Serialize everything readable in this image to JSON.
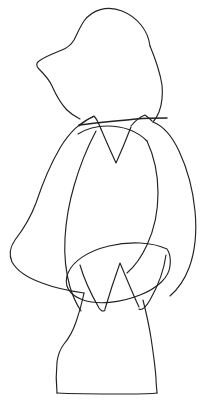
{
  "image": {
    "title": "Contour line drawing of a standing figurine",
    "subject": "bear-like standing figure on a pedestal base",
    "style": "single-weight ink contour line art",
    "background_color": "#ffffff",
    "stroke_color": "#222222",
    "width_px": 205,
    "height_px": 411,
    "caption": ""
  },
  "strokes": [
    {
      "name": "head-and-snout-outline",
      "description": "large rounded head dome sweeping left into a pointed snout and down the jaw to the neck",
      "weight": "normal"
    },
    {
      "name": "head-right-side-to-shoulder",
      "description": "right contour of head descending to the right shoulder",
      "weight": "normal"
    },
    {
      "name": "collar-band-line",
      "description": "near-horizontal band crossing the neck at the shoulders",
      "weight": "heavy"
    },
    {
      "name": "left-collar-peak",
      "description": "small triangular peak of the collar on the left of the neck",
      "weight": "normal"
    },
    {
      "name": "right-collar-peak",
      "description": "small triangular peak of the collar on the right of the neck",
      "weight": "normal"
    },
    {
      "name": "v-neck-line",
      "description": "V shaped neckline descending from the collar into the chest",
      "weight": "normal"
    },
    {
      "name": "chest-arc",
      "description": "broad arc of the upper chest below the collar",
      "weight": "normal"
    },
    {
      "name": "left-arm-outer-contour",
      "description": "long outer sweep of the left arm bulging out to the far left",
      "weight": "normal"
    },
    {
      "name": "left-arm-inner-contour",
      "description": "inner edge of the left arm running down into the waist",
      "weight": "normal"
    },
    {
      "name": "right-arm-outer-contour",
      "description": "outer contour of the right arm running down the right edge",
      "weight": "normal"
    },
    {
      "name": "right-arm-inner-contour",
      "description": "inner edge of the right arm curving into the hip",
      "weight": "normal"
    },
    {
      "name": "lower-ellipse-loop",
      "description": "elongated looping oval across the hips and lower body",
      "weight": "normal"
    },
    {
      "name": "drape-v-notch",
      "description": "pointed V fold of drapery below the hips",
      "weight": "normal"
    },
    {
      "name": "left-drape-flare",
      "description": "flaring drape edge on the lower left",
      "weight": "normal"
    },
    {
      "name": "right-drape-flare",
      "description": "flaring drape edge on the lower right",
      "weight": "normal"
    },
    {
      "name": "torso-left-to-base",
      "description": "left side of the lower torso narrowing then flaring into the pedestal",
      "weight": "normal"
    },
    {
      "name": "torso-right-to-base",
      "description": "right side of the lower torso descending into the pedestal",
      "weight": "normal"
    },
    {
      "name": "pedestal-base-outline",
      "description": "flat bottomed pedestal with slightly splayed sides",
      "weight": "normal"
    }
  ]
}
